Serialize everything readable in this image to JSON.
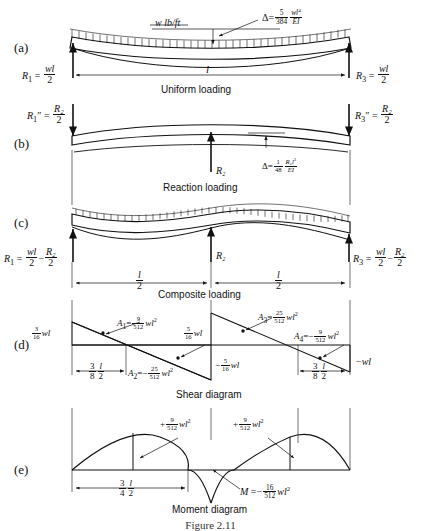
{
  "figure": {
    "caption": "Figure 2.11",
    "panels": [
      {
        "letter": "(a)",
        "title": "Uniform loading"
      },
      {
        "letter": "(b)",
        "title": "Reaction loading"
      },
      {
        "letter": "(c)",
        "title": "Composite loading"
      },
      {
        "letter": "(d)",
        "title": "Shear diagram"
      },
      {
        "letter": "(e)",
        "title": "Moment diagram"
      }
    ]
  },
  "panel_a": {
    "letter": "(a)",
    "title": "Uniform loading",
    "load_label": "w lb/ft",
    "deflection": {
      "symbol": "Δ",
      "equals": "=",
      "coef_num": "5",
      "coef_den": "384",
      "expr_num": "wl",
      "expr_exp": "4",
      "expr_den": "EI"
    },
    "reaction_left": {
      "name": "R",
      "sub": "1",
      "num": "wl",
      "den": "2"
    },
    "reaction_right": {
      "name": "R",
      "sub": "3",
      "num": "wl",
      "den": "2"
    },
    "span_label": "l"
  },
  "panel_b": {
    "letter": "(b)",
    "title": "Reaction loading",
    "reaction_left": {
      "name": "R",
      "sub": "1",
      "prime": "″",
      "num": "R₂",
      "den": "2"
    },
    "reaction_right": {
      "name": "R",
      "sub": "3",
      "prime": "″",
      "num": "R₂",
      "den": "2"
    },
    "center_force": "R₂",
    "deflection": {
      "symbol": "Δ",
      "equals": "=",
      "coef_num": "1",
      "coef_den": "48",
      "expr_num": "R₂l",
      "expr_exp": "3",
      "expr_den": "EI"
    }
  },
  "panel_c": {
    "letter": "(c)",
    "title": "Composite loading",
    "reaction_left": {
      "name": "R",
      "sub": "1",
      "num1": "wl",
      "den1": "2",
      "op": "−",
      "num2": "R₂",
      "den2": "2"
    },
    "reaction_right": {
      "name": "R",
      "sub": "3",
      "num1": "wl",
      "den1": "2",
      "op": "−",
      "num2": "R₂",
      "den2": "2"
    },
    "center_force": "R₂",
    "dim_left": {
      "num1": "l",
      "den1": "2"
    },
    "dim_right": {
      "num1": "l",
      "den1": "2"
    }
  },
  "panel_d": {
    "letter": "(d)",
    "title": "Shear diagram",
    "v_left": {
      "num": "3",
      "den": "16",
      "unit": "wl"
    },
    "v_center_top": {
      "num": "5",
      "den": "16",
      "unit": "wl"
    },
    "v_center_bot": {
      "sign": "−",
      "num": "5",
      "den": "16",
      "unit": "wl"
    },
    "v_right": {
      "sign": "−",
      "unit": "wl"
    },
    "areas": [
      {
        "name": "A",
        "sub": "1",
        "sign": "",
        "num": "9",
        "den": "512",
        "unit": "wl",
        "exp": "2"
      },
      {
        "name": "A",
        "sub": "2",
        "sign": "−",
        "num": "25",
        "den": "512",
        "unit": "wl",
        "exp": "2"
      },
      {
        "name": "A",
        "sub": "3",
        "sign": "",
        "num": "25",
        "den": "512",
        "unit": "wl",
        "exp": "2"
      },
      {
        "name": "A",
        "sub": "4",
        "sign": "−",
        "num": "9",
        "den": "512",
        "unit": "wl",
        "exp": "2"
      }
    ],
    "dim_left": {
      "num1": "3",
      "den1": "8",
      "num2": "l",
      "den2": "2"
    },
    "dim_right": {
      "num1": "3",
      "den1": "8",
      "num2": "l",
      "den2": "2"
    }
  },
  "panel_e": {
    "letter": "(e)",
    "title": "Moment diagram",
    "m_pos_left": {
      "sign": "+",
      "num": "9",
      "den": "512",
      "unit": "wl",
      "exp": "2"
    },
    "m_pos_right": {
      "sign": "+",
      "num": "9",
      "den": "512",
      "unit": "wl",
      "exp": "2"
    },
    "m_neg": {
      "name": "M",
      "equals": "=",
      "sign": "−",
      "num": "16",
      "den": "512",
      "unit": "wl",
      "exp": "2"
    },
    "dim": {
      "num1": "3",
      "den1": "4",
      "num2": "l",
      "den2": "2"
    }
  }
}
